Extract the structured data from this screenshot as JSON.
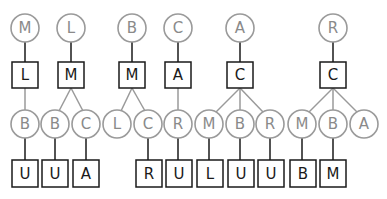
{
  "diagram": {
    "title": "",
    "node_colors": {
      "circle_stroke": "#9a9a9a",
      "circle_text": "#8a8a8a",
      "square_stroke": "#1a1a1a",
      "square_text": "#1a1a1a"
    },
    "trees": [
      {
        "root": {
          "label": "M",
          "x": 25
        },
        "hub": {
          "label": "L",
          "x": 25
        },
        "children": [
          {
            "label": "B",
            "x": 25,
            "leaf": {
              "label": "U",
              "x": 25
            }
          }
        ]
      },
      {
        "root": {
          "label": "L",
          "x": 71
        },
        "hub": {
          "label": "M",
          "x": 71
        },
        "children": [
          {
            "label": "B",
            "x": 55,
            "leaf": {
              "label": "U",
              "x": 55
            }
          },
          {
            "label": "C",
            "x": 86,
            "leaf": {
              "label": "A",
              "x": 86
            }
          }
        ]
      },
      {
        "root": {
          "label": "B",
          "x": 132
        },
        "hub": {
          "label": "M",
          "x": 132
        },
        "children": [
          {
            "label": "L",
            "x": 117,
            "leaf": null
          },
          {
            "label": "C",
            "x": 148,
            "leaf": {
              "label": "R",
              "x": 148
            }
          }
        ]
      },
      {
        "root": {
          "label": "C",
          "x": 178
        },
        "hub": {
          "label": "A",
          "x": 178
        },
        "children": [
          {
            "label": "R",
            "x": 178,
            "leaf": {
              "label": "U",
              "x": 178
            }
          }
        ]
      },
      {
        "root": {
          "label": "A",
          "x": 240
        },
        "hub": {
          "label": "C",
          "x": 240
        },
        "children": [
          {
            "label": "M",
            "x": 209,
            "leaf": {
              "label": "L",
              "x": 209
            }
          },
          {
            "label": "B",
            "x": 240,
            "leaf": {
              "label": "U",
              "x": 240
            }
          },
          {
            "label": "R",
            "x": 270,
            "leaf": {
              "label": "U",
              "x": 270
            }
          }
        ]
      },
      {
        "root": {
          "label": "R",
          "x": 333
        },
        "hub": {
          "label": "C",
          "x": 333
        },
        "children": [
          {
            "label": "M",
            "x": 302,
            "leaf": {
              "label": "B",
              "x": 302
            }
          },
          {
            "label": "B",
            "x": 333,
            "leaf": {
              "label": "M",
              "x": 333
            }
          },
          {
            "label": "A",
            "x": 364,
            "leaf": null
          }
        ]
      }
    ]
  }
}
